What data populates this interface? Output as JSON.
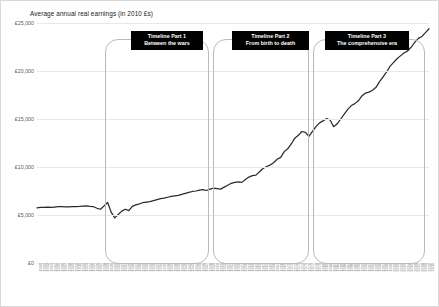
{
  "chart_data": {
    "type": "line",
    "title": "Average annual real earnings (in 2010 £s)",
    "xlabel": "",
    "ylabel": "",
    "ylim": [
      0,
      25000
    ],
    "yticks": [
      0,
      5000,
      10000,
      15000,
      20000,
      25000
    ],
    "ytick_labels": [
      "£0",
      "£5,000",
      "£10,000",
      "£15,000",
      "£20,000",
      "£25,000"
    ],
    "grid": true,
    "legend": "none",
    "series_name": "Average annual real earnings",
    "line_color": "#2b2b2b",
    "x": [
      1900,
      1901,
      1902,
      1903,
      1904,
      1905,
      1906,
      1907,
      1908,
      1909,
      1910,
      1911,
      1912,
      1913,
      1914,
      1915,
      1916,
      1917,
      1918,
      1919,
      1920,
      1921,
      1922,
      1923,
      1924,
      1925,
      1926,
      1927,
      1928,
      1929,
      1930,
      1931,
      1932,
      1933,
      1934,
      1935,
      1936,
      1937,
      1938,
      1939,
      1940,
      1941,
      1942,
      1943,
      1944,
      1945,
      1946,
      1947,
      1948,
      1949,
      1950,
      1951,
      1952,
      1953,
      1954,
      1955,
      1956,
      1957,
      1958,
      1959,
      1960,
      1961,
      1962,
      1963,
      1964,
      1965,
      1966,
      1967,
      1968,
      1969,
      1970,
      1971,
      1972,
      1973,
      1974,
      1975,
      1976,
      1977,
      1978,
      1979,
      1980,
      1981,
      1982,
      1983,
      1984,
      1985,
      1986,
      1987,
      1988,
      1989,
      1990,
      1991,
      1992,
      1993,
      1994,
      1995,
      1996,
      1997,
      1998,
      1999,
      2000,
      2001,
      2002,
      2003,
      2004,
      2005,
      2006,
      2007,
      2008,
      2009,
      2010,
      2011
    ],
    "values": [
      5750,
      5790,
      5800,
      5810,
      5800,
      5830,
      5860,
      5880,
      5850,
      5840,
      5870,
      5880,
      5900,
      5930,
      5950,
      5900,
      5860,
      5700,
      5600,
      5950,
      6300,
      5300,
      4700,
      5050,
      5400,
      5600,
      5450,
      5900,
      6050,
      6150,
      6300,
      6350,
      6400,
      6500,
      6600,
      6700,
      6750,
      6850,
      6950,
      7000,
      7050,
      7150,
      7250,
      7350,
      7450,
      7500,
      7600,
      7650,
      7550,
      7700,
      7800,
      7750,
      7700,
      7900,
      8100,
      8300,
      8400,
      8450,
      8400,
      8700,
      8950,
      9100,
      9150,
      9500,
      9850,
      10050,
      10200,
      10450,
      10800,
      11000,
      11600,
      11900,
      12400,
      13000,
      13300,
      13700,
      13600,
      13200,
      13700,
      14200,
      14600,
      14800,
      15050,
      14900,
      14200,
      14500,
      15000,
      15500,
      16000,
      16400,
      16600,
      16900,
      17400,
      17700,
      17800,
      18000,
      18300,
      18900,
      19400,
      19900,
      20500,
      20900,
      21300,
      21600,
      21900,
      22100,
      22500,
      23000,
      23400,
      23600,
      24000,
      24400
    ]
  },
  "annotations": [
    {
      "id": "part-1",
      "line1": "Timeline Part 1",
      "line2": "Between the wars"
    },
    {
      "id": "part-2",
      "line1": "Timeline Part 2",
      "line2": "From birth to death"
    },
    {
      "id": "part-3",
      "line1": "Timeline Part 3",
      "line2": "The comprehensive era"
    }
  ]
}
